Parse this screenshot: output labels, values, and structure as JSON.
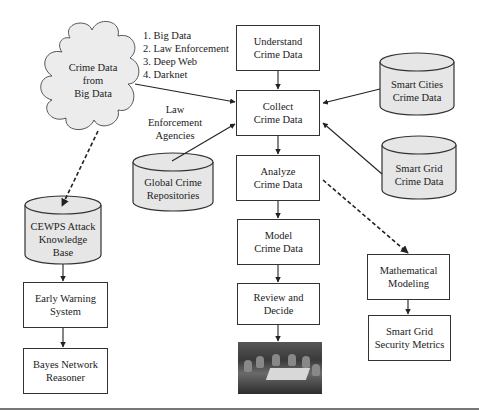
{
  "nodes": {
    "cloud": "Crime Data\nfrom\nBig Data",
    "sources_list": [
      "1. Big Data",
      "2. Law Enforcement",
      "3. Deep Web",
      "4. Darknet"
    ],
    "understand": "Understand\nCrime Data",
    "collect": "Collect\nCrime Data",
    "analyze": "Analyze\nCrime Data",
    "model": "Model\nCrime Data",
    "review": "Review and\nDecide",
    "law_enforcement_label": "Law\nEnforcement\nAgencies",
    "global_repos": "Global Crime\nRepositories",
    "smart_cities": "Smart Cities\nCrime Data",
    "smart_grid": "Smart Grid\nCrime Data",
    "cewps": "CEWPS Attack\nKnowledge\nBase",
    "early_warning": "Early Warning\nSystem",
    "bayes": "Bayes Network\nReasoner",
    "math_modeling": "Mathematical\nModeling",
    "security_metrics": "Smart Grid\nSecurity Metrics"
  },
  "photo": {
    "description": "meeting-room-photo"
  },
  "colors": {
    "cylinder_fill": "#e6e6e6",
    "cloud_fill": "#ececec",
    "stroke": "#333333"
  }
}
